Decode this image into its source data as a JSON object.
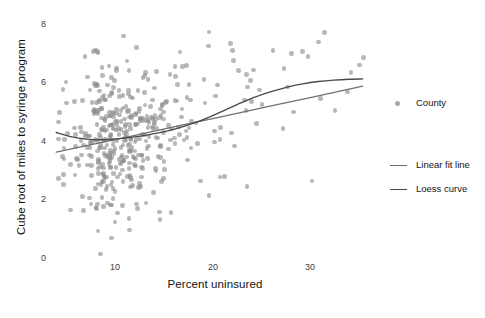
{
  "chart_data": {
    "type": "scatter",
    "title": "",
    "xlabel": "Percent uninsured",
    "ylabel": "Cube root of miles to syringe program",
    "xlim": [
      5.0,
      36.5
    ],
    "ylim": [
      -0.25,
      8.45
    ],
    "xticks": [
      10,
      20,
      30
    ],
    "xticklabels": [
      "10",
      "20",
      "30"
    ],
    "yticks": [
      0,
      2,
      4,
      6,
      8
    ],
    "yticklabels": [
      "0",
      "2",
      "4",
      "6",
      "8"
    ],
    "grid": false,
    "legend_position": "right",
    "point_color": "#8a8a8a",
    "point_opacity": 0.62,
    "line_color_linear": "#6f6f6f",
    "line_color_loess": "#4a4a4a",
    "legend": [
      {
        "name": "County",
        "marker": "circle",
        "color": "#8a8a8a"
      },
      {
        "name": "Linear fit line",
        "marker": "line",
        "color": "#6f6f6f"
      },
      {
        "name": "Loess curve",
        "marker": "line",
        "color": "#4a4a4a"
      }
    ],
    "series": [
      {
        "name": "Linear fit line",
        "type": "line",
        "x": [
          5.6,
          9.0,
          12.0,
          15.0,
          18.0,
          21.0,
          24.0,
          27.0,
          30.0,
          33.0,
          35.3
        ],
        "y": [
          3.54,
          3.8,
          4.03,
          4.26,
          4.49,
          4.72,
          4.95,
          5.18,
          5.41,
          5.64,
          5.82
        ]
      },
      {
        "name": "Loess curve",
        "type": "line",
        "x": [
          5.6,
          7.0,
          8.5,
          10.0,
          11.5,
          13.0,
          14.5,
          16.0,
          17.5,
          19.0,
          20.5,
          22.0,
          23.5,
          25.0,
          26.5,
          28.0,
          29.5,
          31.0,
          32.5,
          34.0,
          35.3
        ],
        "y": [
          4.22,
          4.08,
          3.99,
          3.97,
          4.0,
          4.06,
          4.14,
          4.24,
          4.38,
          4.55,
          4.76,
          5.0,
          5.24,
          5.46,
          5.64,
          5.79,
          5.9,
          5.98,
          6.03,
          6.06,
          6.07
        ]
      },
      {
        "name": "County",
        "type": "scatter",
        "x": [
          6.2,
          6.4,
          6.6,
          6.9,
          7.1,
          7.2,
          7.4,
          7.5,
          7.6,
          7.8,
          7.9,
          8.0,
          8.1,
          8.2,
          8.3,
          8.4,
          8.5,
          8.6,
          8.7,
          8.8,
          8.9,
          9.0,
          9.1,
          9.2,
          9.3,
          9.4,
          9.5,
          9.6,
          9.7,
          9.8,
          9.9,
          10.0,
          10.1,
          10.2,
          10.3,
          10.4,
          10.5,
          10.6,
          10.7,
          10.8,
          10.9,
          11.0,
          11.1,
          11.2,
          11.3,
          11.4,
          11.5,
          11.6,
          11.7,
          11.8,
          11.9,
          12.0,
          12.1,
          12.2,
          12.3,
          12.4,
          12.5,
          12.6,
          12.7,
          12.8,
          12.9,
          13.0,
          13.1,
          13.2,
          13.3,
          13.4,
          13.5,
          13.6,
          13.7,
          13.8,
          13.9,
          14.0,
          14.1,
          14.2,
          14.3,
          14.4,
          14.5,
          14.6,
          14.7,
          14.8,
          14.9,
          15.0,
          15.1,
          15.2,
          15.3,
          15.4,
          15.5,
          15.6,
          15.7,
          15.8,
          15.9,
          16.0,
          16.1,
          16.2,
          16.3,
          16.4,
          16.5,
          16.6,
          16.7,
          16.8,
          16.9,
          17.0,
          17.1,
          17.2,
          17.3,
          17.4,
          17.5,
          17.6,
          17.7,
          17.8,
          17.9,
          18.0,
          18.1,
          18.2,
          18.3,
          18.4,
          18.5,
          18.6,
          18.7,
          18.8,
          18.9,
          19.0,
          19.1,
          19.2,
          19.3,
          19.5,
          19.6,
          19.8,
          20.0,
          20.2,
          20.4,
          20.6,
          20.8,
          21.0,
          21.2,
          21.4,
          21.6,
          21.8,
          22.0,
          22.3,
          22.6,
          22.9,
          23.2,
          23.5,
          23.8,
          24.1,
          24.5,
          24.9,
          25.3,
          25.8,
          26.3,
          26.9,
          27.5,
          28.2,
          29.0,
          30.0,
          31.2,
          32.5,
          34.0,
          35.3
        ],
        "n_points": 420,
        "description": "County-level scatter of cube-root distance to syringe program versus percent uninsured; dense cloud between 8-20 percent uninsured with values mostly 2-7."
      }
    ]
  },
  "axis": {
    "y_title": "Cube root of miles to syringe program",
    "x_title": "Percent uninsured",
    "yticklabels": [
      "8",
      "6",
      "4",
      "2",
      "0"
    ],
    "xticklabels": [
      "10",
      "20",
      "30"
    ]
  },
  "legend": {
    "county_label": "County",
    "linear_label": "Linear fit line",
    "loess_label": "Loess curve"
  }
}
